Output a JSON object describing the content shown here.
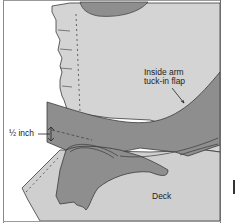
{
  "figure": {
    "labels": {
      "flap_line1": "Inside arm",
      "flap_line2": "tuck-in flap",
      "half_inch": "½ inch",
      "deck": "Deck"
    },
    "colors": {
      "background": "#ffffff",
      "arm_panel": "#d4d4d4",
      "flap": "#8e8e8e",
      "deck": "#cfcfcf",
      "outline": "#3a3a3a",
      "frame": "#6d6d6d"
    }
  }
}
